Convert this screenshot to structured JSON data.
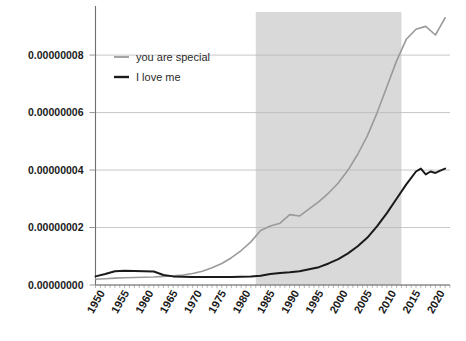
{
  "chart_data": {
    "type": "line",
    "title": "",
    "xlabel": "",
    "ylabel": "",
    "xlim": [
      1948,
      2021
    ],
    "ylim": [
      0,
      9.5e-08
    ],
    "grid": true,
    "legend_position": "top-left",
    "y_ticks": [
      {
        "value": 0.0,
        "label": "0.00000000"
      },
      {
        "value": 2e-08,
        "label": "0.00000002"
      },
      {
        "value": 4e-08,
        "label": "0.00000004"
      },
      {
        "value": 6e-08,
        "label": "0.00000006"
      },
      {
        "value": 8e-08,
        "label": "0.00000008"
      }
    ],
    "x_ticks": [
      {
        "value": 1950,
        "label": "1950"
      },
      {
        "value": 1955,
        "label": "1955"
      },
      {
        "value": 1960,
        "label": "1960"
      },
      {
        "value": 1965,
        "label": "1965"
      },
      {
        "value": 1970,
        "label": "1970"
      },
      {
        "value": 1975,
        "label": "1975"
      },
      {
        "value": 1980,
        "label": "1980"
      },
      {
        "value": 1985,
        "label": "1985"
      },
      {
        "value": 1990,
        "label": "1990"
      },
      {
        "value": 1995,
        "label": "1995"
      },
      {
        "value": 2000,
        "label": "2000"
      },
      {
        "value": 2005,
        "label": "2005"
      },
      {
        "value": 2010,
        "label": "2010"
      },
      {
        "value": 2015,
        "label": "2015"
      },
      {
        "value": 2020,
        "label": "2020"
      }
    ],
    "x_minor_tick_step": 1,
    "shaded_region": {
      "x_start": 1981,
      "x_end": 2011,
      "color": "#d9d9d9"
    },
    "series": [
      {
        "name": "you are special",
        "color": "#9a9a9a",
        "width": 1.6,
        "x": [
          1948,
          1950,
          1952,
          1954,
          1956,
          1958,
          1960,
          1962,
          1964,
          1966,
          1968,
          1970,
          1972,
          1974,
          1976,
          1978,
          1980,
          1982,
          1984,
          1986,
          1988,
          1990,
          1992,
          1994,
          1996,
          1998,
          2000,
          2002,
          2004,
          2006,
          2008,
          2010,
          2012,
          2014,
          2016,
          2018,
          2019,
          2020
        ],
        "y": [
          2e-09,
          2.2e-09,
          2.4e-09,
          2.5e-09,
          2.6e-09,
          2.7e-09,
          2.8e-09,
          3e-09,
          3.2e-09,
          3.5e-09,
          4e-09,
          4.8e-09,
          6e-09,
          7.5e-09,
          9.5e-09,
          1.2e-08,
          1.5e-08,
          1.9e-08,
          2.05e-08,
          2.15e-08,
          2.45e-08,
          2.4e-08,
          2.65e-08,
          2.9e-08,
          3.2e-08,
          3.55e-08,
          4e-08,
          4.55e-08,
          5.2e-08,
          6e-08,
          6.9e-08,
          7.8e-08,
          8.55e-08,
          8.9e-08,
          9e-08,
          8.7e-08,
          9e-08,
          9.3e-08
        ]
      },
      {
        "name": "I love me",
        "color": "#1a1a1a",
        "width": 2.0,
        "x": [
          1948,
          1950,
          1952,
          1954,
          1956,
          1958,
          1960,
          1962,
          1964,
          1966,
          1968,
          1970,
          1972,
          1974,
          1976,
          1978,
          1980,
          1982,
          1984,
          1986,
          1988,
          1990,
          1992,
          1994,
          1996,
          1998,
          2000,
          2002,
          2004,
          2006,
          2008,
          2010,
          2012,
          2014,
          2015,
          2016,
          2017,
          2018,
          2019,
          2020
        ],
        "y": [
          3e-09,
          3.8e-09,
          4.8e-09,
          5e-09,
          4.9e-09,
          4.8e-09,
          4.7e-09,
          3.5e-09,
          3e-09,
          2.9e-09,
          2.8e-09,
          2.8e-09,
          2.8e-09,
          2.8e-09,
          2.8e-09,
          2.9e-09,
          3e-09,
          3.2e-09,
          3.8e-09,
          4.2e-09,
          4.4e-09,
          4.8e-09,
          5.5e-09,
          6.2e-09,
          7.5e-09,
          9e-09,
          1.1e-08,
          1.35e-08,
          1.65e-08,
          2.05e-08,
          2.5e-08,
          3e-08,
          3.5e-08,
          3.95e-08,
          4.05e-08,
          3.85e-08,
          3.95e-08,
          3.9e-08,
          3.98e-08,
          4.05e-08
        ]
      }
    ]
  },
  "legend": {
    "items": [
      {
        "label": "you are special",
        "color": "#9a9a9a"
      },
      {
        "label": "I love me",
        "color": "#1a1a1a"
      }
    ]
  },
  "axes": {
    "spine_color": "#6f6f6f",
    "grid_color": "#b9b9b9",
    "tick_color": "#8a8a8a"
  }
}
